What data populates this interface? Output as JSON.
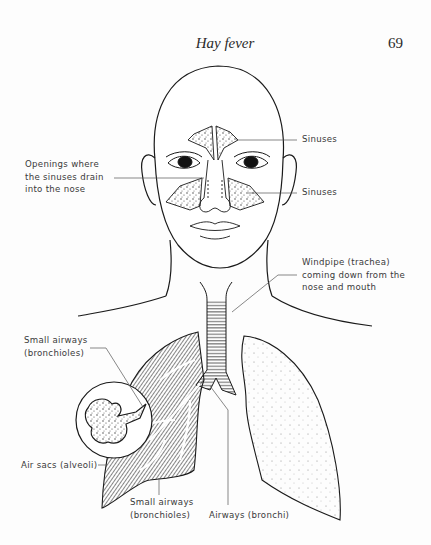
{
  "header": {
    "running_title": "Hay fever",
    "page_number": "69"
  },
  "figure": {
    "labels": {
      "sinuses_upper": "Sinuses",
      "sinuses_lower": "Sinuses",
      "openings": "Openings where\nthe sinuses drain\ninto the nose",
      "windpipe": "Windpipe (trachea)\ncoming down from the\nnose and mouth",
      "small_airways_upper": "Small airways\n(bronchioles)",
      "air_sacs": "Air sacs (alveoli)",
      "small_airways_lower": "Small airways\n(bronchioles)",
      "airways_bronchi": "Airways (bronchi)"
    },
    "colors": {
      "ink": "#1a1a1a",
      "label_text": "#3a3a3a",
      "leader_line": "#555555",
      "paper": "#fdfdfd"
    }
  }
}
